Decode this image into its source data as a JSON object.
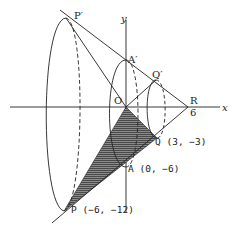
{
  "figure": {
    "type": "3d-solid-of-revolution",
    "axes": {
      "x_label": "x",
      "y_label": "y",
      "origin_label": "O"
    },
    "points": {
      "P_prime": "P′",
      "A_prime": "A′",
      "Q_prime": "Q′",
      "R": "R",
      "R_tick": "6",
      "Q": "Q (3, −3)",
      "A": "A (0, −6)",
      "P": "P (−6, −12)"
    },
    "coordinates": {
      "O": [
        0,
        0
      ],
      "R": [
        6,
        0
      ],
      "Q": [
        3,
        -3
      ],
      "A": [
        0,
        -6
      ],
      "P": [
        -6,
        -12
      ]
    },
    "shaded_region": "triangle O-Q-P (hatched)",
    "colors": {
      "line": "#222222",
      "hatch": "#555555",
      "background": "#ffffff"
    }
  }
}
